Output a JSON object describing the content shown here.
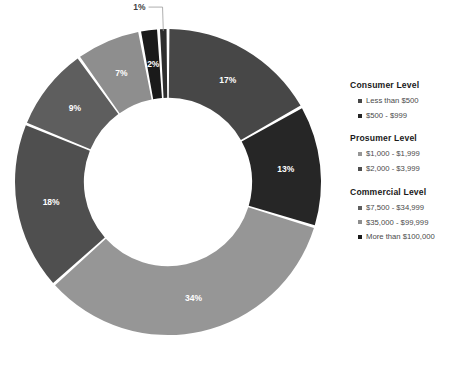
{
  "chart_data": {
    "type": "pie",
    "variant": "donut",
    "title": "",
    "subtitle": "",
    "xlabel": "",
    "ylabel": "",
    "grid": false,
    "legend_position": "right",
    "start_angle_deg": 0,
    "direction": "clockwise",
    "inner_radius_ratio": 0.55,
    "categories": [
      "Less than $500",
      "$500 - $999",
      "$1,000 - $1,999",
      "$2,000 - $3,999",
      "$7,500 - $34,999",
      "$35,000 - $99,999",
      "More than $100,000"
    ],
    "values": [
      17,
      13,
      34,
      18,
      9,
      7,
      2
    ],
    "slices": [
      {
        "label": "17%",
        "value": 17,
        "color": "#474747",
        "label_color": "#ffffff",
        "label_placement": "inside"
      },
      {
        "label": "13%",
        "value": 13,
        "color": "#262626",
        "label_color": "#ffffff",
        "label_placement": "inside"
      },
      {
        "label": "34%",
        "value": 34,
        "color": "#969696",
        "label_color": "#ffffff",
        "label_placement": "inside"
      },
      {
        "label": "18%",
        "value": 18,
        "color": "#4f4f4f",
        "label_color": "#ffffff",
        "label_placement": "inside"
      },
      {
        "label": "9%",
        "value": 9,
        "color": "#5e5e5e",
        "label_color": "#ffffff",
        "label_placement": "inside"
      },
      {
        "label": "7%",
        "value": 7,
        "color": "#8e8e8e",
        "label_color": "#ffffff",
        "label_placement": "inside"
      },
      {
        "label": "2%",
        "value": 2,
        "color": "#1a1a1a",
        "label_color": "#ffffff",
        "label_placement": "inside"
      },
      {
        "label": "1%",
        "value": 1,
        "color": "#2e2e2e",
        "label_color": "#3f3f3f",
        "label_placement": "outside"
      }
    ],
    "data_labels": [
      "17%",
      "13%",
      "34%",
      "18%",
      "9%",
      "7%",
      "2%",
      "1%"
    ],
    "colors": [
      "#474747",
      "#262626",
      "#969696",
      "#4f4f4f",
      "#5e5e5e",
      "#8e8e8e",
      "#1a1a1a",
      "#2e2e2e"
    ],
    "slice_gap_color": "#ffffff"
  },
  "legend": {
    "groups": [
      {
        "title": "Consumer Level",
        "items": [
          {
            "label": "Less than $500",
            "color": "#474747"
          },
          {
            "label": "$500 - $999",
            "color": "#262626"
          }
        ]
      },
      {
        "title": "Prosumer Level",
        "items": [
          {
            "label": "$1,000 - $1,999",
            "color": "#969696"
          },
          {
            "label": "$2,000 - $3,999",
            "color": "#4f4f4f"
          }
        ]
      },
      {
        "title": "Commercial Level",
        "items": [
          {
            "label": "$7,500 - $34,999",
            "color": "#5e5e5e"
          },
          {
            "label": "$35,000 - $99,999",
            "color": "#8e8e8e"
          },
          {
            "label": "More than $100,000",
            "color": "#1a1a1a"
          }
        ]
      }
    ]
  }
}
